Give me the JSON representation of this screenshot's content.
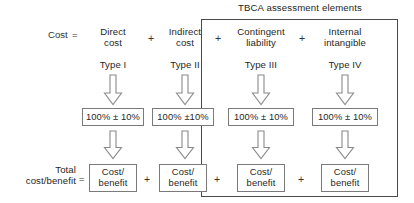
{
  "diagram": {
    "title": "TBCA assessment elements",
    "equation_label": "Cost",
    "equation_sign": "=",
    "total_label": "Total\ncost/benefit",
    "total_sign": "=",
    "plus": "+",
    "arrow_icon": "down-block-arrow-icon",
    "columns": [
      {
        "id": "direct-cost",
        "term": "Direct\ncost",
        "type": "Type I",
        "uncertainty": "100% ± 10%",
        "result": "Cost/\nbenefit",
        "inside_frame": false,
        "leading_plus": false
      },
      {
        "id": "indirect-cost",
        "term": "Indirect\ncost",
        "type": "Type II",
        "uncertainty": "100% ±10%",
        "result": "Cost/\nbenefit",
        "inside_frame": false,
        "leading_plus": true
      },
      {
        "id": "contingent-liability",
        "term": "Contingent\nliability",
        "type": "Type III",
        "uncertainty": "100%  ± 10%",
        "result": "Cost/\nbenefit",
        "inside_frame": true,
        "leading_plus": true
      },
      {
        "id": "internal-intangible",
        "term": "Internal\nintangible",
        "type": "Type IV",
        "uncertainty": "100% ± 10%",
        "result": "Cost/\nbenefit",
        "inside_frame": true,
        "leading_plus": true
      }
    ],
    "colors": {
      "frame_stroke": "#4a4a4a",
      "box_stroke": "#7a7a7a",
      "arrow_stroke": "#8a8a8a",
      "text": "#1f1f1f",
      "background": "#ffffff"
    }
  }
}
